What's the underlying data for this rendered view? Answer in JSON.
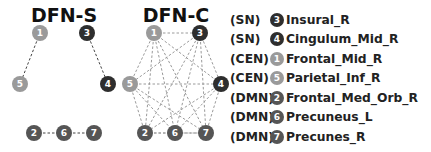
{
  "panels": [
    {
      "id": "dfn-s",
      "title": "DFN-S",
      "nodes": [
        {
          "id": "1",
          "label": "1",
          "x": 40,
          "y": 33,
          "color": "#9a9a9a"
        },
        {
          "id": "3",
          "label": "3",
          "x": 87,
          "y": 33,
          "color": "#2e2e2e"
        },
        {
          "id": "5",
          "label": "5",
          "x": 20,
          "y": 84,
          "color": "#9a9a9a"
        },
        {
          "id": "4",
          "label": "4",
          "x": 108,
          "y": 84,
          "color": "#2e2e2e"
        },
        {
          "id": "2",
          "label": "2",
          "x": 34,
          "y": 133,
          "color": "#555555"
        },
        {
          "id": "6",
          "label": "6",
          "x": 64,
          "y": 133,
          "color": "#555555"
        },
        {
          "id": "7",
          "label": "7",
          "x": 94,
          "y": 133,
          "color": "#555555"
        }
      ],
      "edges": [
        [
          "1",
          "5"
        ],
        [
          "3",
          "4"
        ],
        [
          "2",
          "6"
        ],
        [
          "6",
          "7"
        ]
      ]
    },
    {
      "id": "dfn-c",
      "title": "DFN-C",
      "nodes": [
        {
          "id": "1",
          "label": "1",
          "x": 154,
          "y": 33,
          "color": "#9a9a9a"
        },
        {
          "id": "3",
          "label": "3",
          "x": 200,
          "y": 33,
          "color": "#2e2e2e"
        },
        {
          "id": "5",
          "label": "5",
          "x": 130,
          "y": 84,
          "color": "#9a9a9a"
        },
        {
          "id": "4",
          "label": "4",
          "x": 221,
          "y": 84,
          "color": "#2e2e2e"
        },
        {
          "id": "2",
          "label": "2",
          "x": 145,
          "y": 133,
          "color": "#555555"
        },
        {
          "id": "6",
          "label": "6",
          "x": 175,
          "y": 133,
          "color": "#555555"
        },
        {
          "id": "7",
          "label": "7",
          "x": 206,
          "y": 133,
          "color": "#555555"
        }
      ],
      "edges": "complete"
    }
  ],
  "legend": [
    {
      "network": "(SN)",
      "node": "3",
      "color": "#2e2e2e",
      "region": "Insural_R"
    },
    {
      "network": "(SN)",
      "node": "4",
      "color": "#2e2e2e",
      "region": "Cingulum_Mid_R"
    },
    {
      "network": "(CEN)",
      "node": "1",
      "color": "#9a9a9a",
      "region": "Frontal_Mid_R"
    },
    {
      "network": "(CEN)",
      "node": "5",
      "color": "#9a9a9a",
      "region": "Parietal_Inf_R"
    },
    {
      "network": "(DMN)",
      "node": "2",
      "color": "#555555",
      "region": "Frontal_Med_Orb_R"
    },
    {
      "network": "(DMN)",
      "node": "6",
      "color": "#555555",
      "region": "Precuneus_L"
    },
    {
      "network": "(DMN)",
      "node": "7",
      "color": "#555555",
      "region": "Precunes_R"
    }
  ]
}
